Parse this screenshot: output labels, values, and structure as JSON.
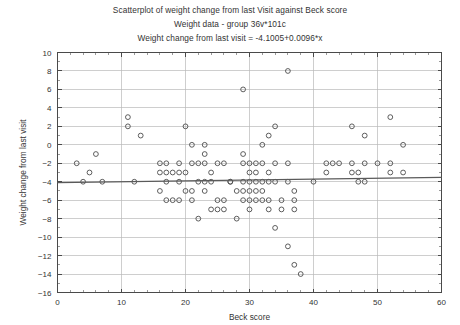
{
  "chart_data": {
    "type": "scatter",
    "title": "Scatterplot of weight change from last Visit against Beck score",
    "subtitle": "Weight data - group 36v*101c",
    "annotation": "Weight change from last visit = -4.1005+0.0096*x",
    "xlabel": "Beck score",
    "ylabel": "Weight change from last visit",
    "xlim": [
      0,
      60
    ],
    "ylim": [
      -16,
      10
    ],
    "xticks": [
      0,
      10,
      20,
      30,
      40,
      50,
      60
    ],
    "yticks": [
      10,
      8,
      6,
      4,
      2,
      0,
      -2,
      -4,
      -6,
      -8,
      -10,
      -12,
      -14,
      -16
    ],
    "grid": true,
    "legend": "none",
    "marker": "open-circle",
    "marker_color": "#4c4c4c",
    "fit": {
      "kind": "linear",
      "intercept": -4.1005,
      "slope": 0.0096,
      "color": "#5a5a5a"
    },
    "points": [
      [
        3,
        -2
      ],
      [
        4,
        -4
      ],
      [
        5,
        -3
      ],
      [
        6,
        -1
      ],
      [
        7,
        -4
      ],
      [
        11,
        3
      ],
      [
        11,
        2
      ],
      [
        12,
        -4
      ],
      [
        13,
        1
      ],
      [
        16,
        -2
      ],
      [
        16,
        -5
      ],
      [
        16,
        -3
      ],
      [
        17,
        -2
      ],
      [
        17,
        -3
      ],
      [
        17,
        -4
      ],
      [
        17,
        -6
      ],
      [
        18,
        -3
      ],
      [
        18,
        -6
      ],
      [
        19,
        -2
      ],
      [
        19,
        -3
      ],
      [
        19,
        -4
      ],
      [
        19,
        -6
      ],
      [
        20,
        2
      ],
      [
        20,
        -3
      ],
      [
        20,
        -5
      ],
      [
        21,
        0
      ],
      [
        21,
        -2
      ],
      [
        21,
        -5
      ],
      [
        21,
        -6
      ],
      [
        22,
        -2
      ],
      [
        22,
        -4
      ],
      [
        22,
        -8
      ],
      [
        23,
        0
      ],
      [
        23,
        -1
      ],
      [
        23,
        -2
      ],
      [
        23,
        -4
      ],
      [
        23,
        -5
      ],
      [
        24,
        -3
      ],
      [
        24,
        -4
      ],
      [
        24,
        -7
      ],
      [
        25,
        -2
      ],
      [
        25,
        -6
      ],
      [
        25,
        -7
      ],
      [
        26,
        -2
      ],
      [
        26,
        -6
      ],
      [
        26,
        -7
      ],
      [
        27,
        -4
      ],
      [
        27,
        -4
      ],
      [
        28,
        -5
      ],
      [
        28,
        -8
      ],
      [
        29,
        6
      ],
      [
        29,
        -1
      ],
      [
        29,
        -2
      ],
      [
        29,
        -4
      ],
      [
        29,
        -5
      ],
      [
        29,
        -6
      ],
      [
        30,
        -2
      ],
      [
        30,
        -3
      ],
      [
        30,
        -4
      ],
      [
        30,
        -5
      ],
      [
        30,
        -6
      ],
      [
        30,
        -7
      ],
      [
        31,
        -2
      ],
      [
        31,
        -3
      ],
      [
        31,
        -4
      ],
      [
        31,
        -5
      ],
      [
        31,
        -6
      ],
      [
        32,
        0
      ],
      [
        32,
        -2
      ],
      [
        32,
        -4
      ],
      [
        32,
        -5
      ],
      [
        32,
        -6
      ],
      [
        33,
        1
      ],
      [
        33,
        -3
      ],
      [
        33,
        -4
      ],
      [
        33,
        -6
      ],
      [
        33,
        -7
      ],
      [
        34,
        2
      ],
      [
        34,
        -2
      ],
      [
        34,
        -4
      ],
      [
        34,
        -9
      ],
      [
        35,
        -6
      ],
      [
        35,
        -7
      ],
      [
        36,
        8
      ],
      [
        36,
        -2
      ],
      [
        36,
        -4
      ],
      [
        36,
        -11
      ],
      [
        37,
        -5
      ],
      [
        37,
        -6
      ],
      [
        37,
        -7
      ],
      [
        37,
        -13
      ],
      [
        38,
        -14
      ],
      [
        40,
        -4
      ],
      [
        42,
        -2
      ],
      [
        42,
        -3
      ],
      [
        43,
        -2
      ],
      [
        44,
        -2
      ],
      [
        46,
        2
      ],
      [
        46,
        -3
      ],
      [
        46,
        -2
      ],
      [
        47,
        -3
      ],
      [
        47,
        -4
      ],
      [
        48,
        1
      ],
      [
        48,
        -2
      ],
      [
        48,
        -4
      ],
      [
        50,
        -2
      ],
      [
        52,
        3
      ],
      [
        52,
        -2
      ],
      [
        52,
        -3
      ],
      [
        54,
        0
      ],
      [
        54,
        -3
      ]
    ]
  }
}
